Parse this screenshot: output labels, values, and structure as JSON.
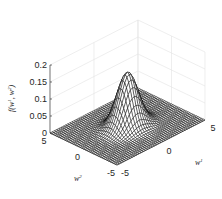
{
  "chart_data": {
    "type": "surface",
    "title": "",
    "function": "2D Gaussian density f(w1, w2) with zero mean, peak ≈ 0.16 at origin",
    "xlabel": "w^1",
    "ylabel": "w^2",
    "zlabel": "f(w^1, w^2)",
    "xlim": [
      -5,
      5
    ],
    "ylim": [
      -5,
      5
    ],
    "zlim": [
      0,
      0.2
    ],
    "x_ticks": [
      -5,
      0,
      5
    ],
    "y_ticks": [
      -5,
      0,
      5
    ],
    "z_ticks": [
      0,
      0.05,
      0.1,
      0.15,
      0.2
    ],
    "x_tick_labels": [
      "-5",
      "0",
      "5"
    ],
    "y_tick_labels": [
      "-5",
      "0",
      "5"
    ],
    "z_tick_labels": [
      "0",
      "0.05",
      "0.1",
      "0.15",
      "0.2"
    ],
    "peak_value": 0.16,
    "sigma": 1.0,
    "grid_resolution": 41,
    "grid": true,
    "mesh_color": "#000000",
    "face_color": "#ffffff",
    "grid_color": "#e3e3e3"
  },
  "labels": {
    "zlabel_main": "f",
    "zlabel_args": "(w",
    "zlabel_sup1": "1",
    "zlabel_mid": ", w",
    "zlabel_sup2": "2",
    "zlabel_close": ")",
    "xlabel_base": "w",
    "xlabel_sup": "1",
    "ylabel_base": "w",
    "ylabel_sup": "2"
  }
}
